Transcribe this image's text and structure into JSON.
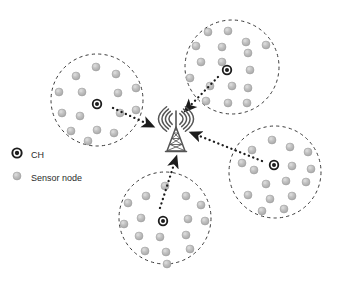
{
  "figure": {
    "background_color": "#ffffff"
  },
  "colors": {
    "sensor_node_fill": "#b9b9b9",
    "sensor_node_stroke": "#9a9a9a",
    "sensor_node_highlight": "#d8d8d8",
    "cluster_head_ring": "#1c1c1c",
    "cluster_head_inner": "#ffffff",
    "cluster_head_center": "#1c1c1c",
    "cluster_boundary": "#3a3a3a",
    "arrow": "#1c1c1c",
    "tower": "#555555",
    "legend_text": "#2b2b2b"
  },
  "legend": {
    "items": [
      {
        "id": "cluster-head",
        "label": "CH",
        "marker": "ch-icon",
        "marker_x": 17,
        "marker_y": 153,
        "label_x": 31,
        "label_y": 156
      },
      {
        "id": "sensor-node",
        "label": "Sensor node",
        "marker": "sensor-node-icon",
        "marker_x": 17,
        "marker_y": 176,
        "label_x": 31,
        "label_y": 179
      }
    ]
  },
  "base_station": {
    "name": "base-station-tower",
    "label": "",
    "x": 176,
    "y": 138,
    "wave_count": 4
  },
  "clusters": [
    {
      "id": "cluster-top-left",
      "cx": 97,
      "cy": 100,
      "r": 46,
      "head": {
        "x": 97,
        "y": 104
      },
      "nodes": [
        {
          "x": 96,
          "y": 67
        },
        {
          "x": 76,
          "y": 76
        },
        {
          "x": 116,
          "y": 74
        },
        {
          "x": 59,
          "y": 92
        },
        {
          "x": 82,
          "y": 92
        },
        {
          "x": 118,
          "y": 93
        },
        {
          "x": 136,
          "y": 88
        },
        {
          "x": 62,
          "y": 113
        },
        {
          "x": 80,
          "y": 116
        },
        {
          "x": 120,
          "y": 113
        },
        {
          "x": 136,
          "y": 110
        },
        {
          "x": 71,
          "y": 131
        },
        {
          "x": 97,
          "y": 130
        },
        {
          "x": 114,
          "y": 133
        },
        {
          "x": 88,
          "y": 141
        }
      ],
      "arrow": {
        "x1": 113,
        "y1": 108,
        "x2": 152,
        "y2": 126
      }
    },
    {
      "id": "cluster-top-right",
      "cx": 232,
      "cy": 67,
      "r": 47,
      "head": {
        "x": 227,
        "y": 70
      },
      "nodes": [
        {
          "x": 208,
          "y": 32
        },
        {
          "x": 228,
          "y": 31
        },
        {
          "x": 246,
          "y": 42
        },
        {
          "x": 196,
          "y": 46
        },
        {
          "x": 222,
          "y": 47
        },
        {
          "x": 266,
          "y": 45
        },
        {
          "x": 201,
          "y": 62
        },
        {
          "x": 222,
          "y": 62
        },
        {
          "x": 248,
          "y": 53
        },
        {
          "x": 250,
          "y": 70
        },
        {
          "x": 190,
          "y": 78
        },
        {
          "x": 210,
          "y": 86
        },
        {
          "x": 232,
          "y": 86
        },
        {
          "x": 248,
          "y": 88
        },
        {
          "x": 206,
          "y": 101
        },
        {
          "x": 228,
          "y": 103
        },
        {
          "x": 247,
          "y": 103
        }
      ],
      "arrow": {
        "x1": 218,
        "y1": 77,
        "x2": 186,
        "y2": 110
      }
    },
    {
      "id": "cluster-right",
      "cx": 275,
      "cy": 172,
      "r": 46,
      "head": {
        "x": 274,
        "y": 165
      },
      "nodes": [
        {
          "x": 272,
          "y": 140
        },
        {
          "x": 290,
          "y": 147
        },
        {
          "x": 252,
          "y": 150
        },
        {
          "x": 308,
          "y": 152
        },
        {
          "x": 242,
          "y": 163
        },
        {
          "x": 254,
          "y": 170
        },
        {
          "x": 292,
          "y": 166
        },
        {
          "x": 311,
          "y": 169
        },
        {
          "x": 266,
          "y": 184
        },
        {
          "x": 286,
          "y": 181
        },
        {
          "x": 306,
          "y": 182
        },
        {
          "x": 248,
          "y": 195
        },
        {
          "x": 270,
          "y": 199
        },
        {
          "x": 292,
          "y": 196
        },
        {
          "x": 262,
          "y": 211
        },
        {
          "x": 284,
          "y": 209
        }
      ],
      "arrow": {
        "x1": 262,
        "y1": 161,
        "x2": 192,
        "y2": 133
      }
    },
    {
      "id": "cluster-bottom",
      "cx": 165,
      "cy": 218,
      "r": 46,
      "head": {
        "x": 163,
        "y": 221
      },
      "nodes": [
        {
          "x": 165,
          "y": 186
        },
        {
          "x": 146,
          "y": 196
        },
        {
          "x": 186,
          "y": 196
        },
        {
          "x": 128,
          "y": 203
        },
        {
          "x": 201,
          "y": 205
        },
        {
          "x": 141,
          "y": 218
        },
        {
          "x": 188,
          "y": 219
        },
        {
          "x": 205,
          "y": 221
        },
        {
          "x": 124,
          "y": 224
        },
        {
          "x": 139,
          "y": 236
        },
        {
          "x": 160,
          "y": 237
        },
        {
          "x": 186,
          "y": 235
        },
        {
          "x": 145,
          "y": 251
        },
        {
          "x": 166,
          "y": 252
        },
        {
          "x": 190,
          "y": 249
        },
        {
          "x": 167,
          "y": 264
        }
      ],
      "arrow": {
        "x1": 160,
        "y1": 208,
        "x2": 176,
        "y2": 158
      }
    }
  ]
}
